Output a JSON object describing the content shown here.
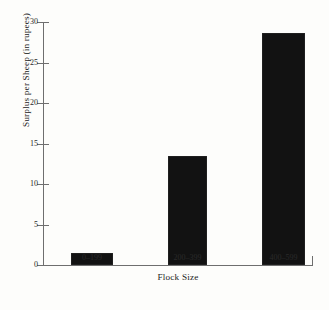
{
  "chart_data": {
    "type": "bar",
    "title": "",
    "subtitle": "",
    "xlabel": "Flock Size",
    "ylabel": "Surplus per Sheep (in rupees)",
    "categories": [
      "0–199",
      "200–399",
      "400–599"
    ],
    "values": [
      1.5,
      13.4,
      28.6
    ],
    "ylim": [
      0,
      30
    ],
    "y_ticks": [
      0,
      5,
      10,
      15,
      20,
      25,
      30
    ],
    "y_tick_labels": [
      "0",
      "5",
      "10",
      "15",
      "20",
      "25",
      "30"
    ],
    "grid": false,
    "legend": null,
    "legend_position": "none",
    "bar_color": "#121212",
    "axis_color": "#6e6e6e",
    "background_color": "#fdfdfb",
    "annotations": []
  },
  "axes": {
    "y_title": "Surplus per Sheep (in rupees)",
    "x_title": "Flock Size"
  }
}
